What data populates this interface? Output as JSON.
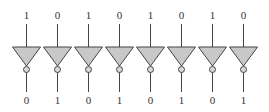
{
  "diagram": {
    "type": "array of NOT gates (inverters)",
    "gate_fill": "#c8c8c8",
    "stroke": "#444444",
    "gates": [
      {
        "input": "1",
        "output": "0"
      },
      {
        "input": "0",
        "output": "1"
      },
      {
        "input": "1",
        "output": "0"
      },
      {
        "input": "0",
        "output": "1"
      },
      {
        "input": "1",
        "output": "0"
      },
      {
        "input": "0",
        "output": "1"
      },
      {
        "input": "1",
        "output": "0"
      },
      {
        "input": "0",
        "output": "1"
      }
    ]
  }
}
